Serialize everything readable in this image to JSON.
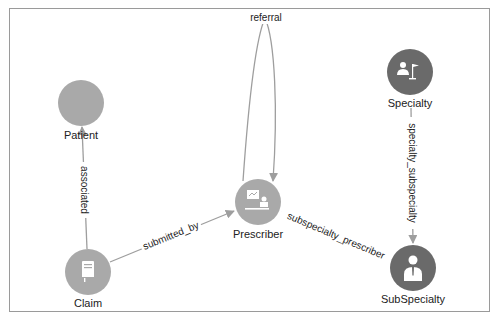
{
  "graph": {
    "colors": {
      "node_light": "#a9a9a9",
      "node_dark": "#6a6a6a",
      "edge": "#9e9e9e",
      "frame": "#9a9a9a",
      "text": "#222222",
      "icon": "#ffffff"
    },
    "nodes": [
      {
        "id": "patient",
        "label": "Patient",
        "icon": "none",
        "style": "light"
      },
      {
        "id": "specialty",
        "label": "Specialty",
        "icon": "person-with-flag-icon",
        "style": "dark"
      },
      {
        "id": "prescriber",
        "label": "Prescriber",
        "icon": "presenter-board-icon",
        "style": "light"
      },
      {
        "id": "claim",
        "label": "Claim",
        "icon": "book-icon",
        "style": "light"
      },
      {
        "id": "subspecialty",
        "label": "SubSpecialty",
        "icon": "person-tie-icon",
        "style": "dark"
      }
    ],
    "edges": [
      {
        "id": "referral",
        "label": "referral",
        "from": "prescriber",
        "to": "prescriber"
      },
      {
        "id": "associated",
        "label": "associated",
        "from": "claim",
        "to": "patient"
      },
      {
        "id": "submitted_by",
        "label": "submitted_by",
        "from": "claim",
        "to": "prescriber"
      },
      {
        "id": "specialty_subspecialty",
        "label": "specialty_subspecialty",
        "from": "specialty",
        "to": "subspecialty"
      },
      {
        "id": "subspecialty_prescriber",
        "label": "subspecialty_prescriber",
        "from": "subspecialty",
        "to": "prescriber"
      }
    ]
  }
}
